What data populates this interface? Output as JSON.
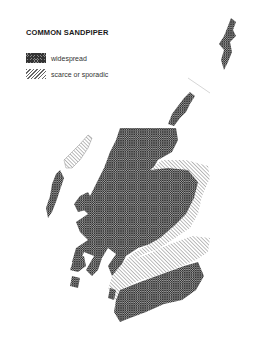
{
  "map": {
    "title": "COMMON SANDPIPER",
    "region": "Scotland",
    "legend": [
      {
        "key": "widespread",
        "label": "widespread",
        "pattern": "dense-crosshatch"
      },
      {
        "key": "scarce",
        "label": "scarce or sporadic",
        "pattern": "diagonal-lines"
      }
    ]
  }
}
